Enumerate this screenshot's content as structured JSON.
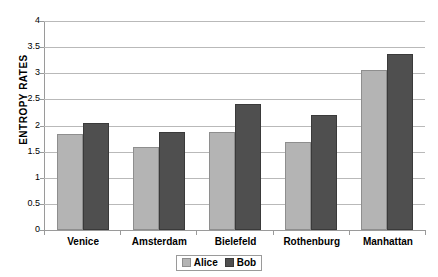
{
  "chart_data": {
    "type": "bar",
    "title": "",
    "xlabel": "",
    "ylabel": "ENTROPY RATES",
    "ylim": [
      0,
      4
    ],
    "ytick_labels": [
      "4",
      "3.5",
      "3",
      "2.5",
      "2",
      "1.5",
      "1",
      "0.5",
      "0"
    ],
    "ytick_values": [
      4,
      3.5,
      3,
      2.5,
      2,
      1.5,
      1,
      0.5,
      0
    ],
    "grid": true,
    "legend_position": "bottom-center",
    "categories": [
      "Venice",
      "Amsterdam",
      "Bielefeld",
      "Rothenburg",
      "Manhattan"
    ],
    "series": [
      {
        "name": "Alice",
        "color": "#b4b4b4",
        "values": [
          1.84,
          1.58,
          1.87,
          1.68,
          3.06
        ]
      },
      {
        "name": "Bob",
        "color": "#4f4f4f",
        "values": [
          2.05,
          1.88,
          2.42,
          2.2,
          3.37
        ]
      }
    ]
  }
}
